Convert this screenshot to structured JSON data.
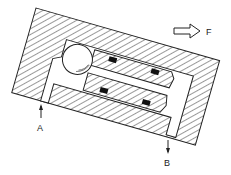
{
  "diagram": {
    "type": "cross-section",
    "labels": {
      "port_a": "A",
      "port_b": "B",
      "force": "F"
    },
    "colors": {
      "line": "#222222",
      "hatch": "#333333",
      "background": "#ffffff",
      "seal": "#111111"
    }
  }
}
